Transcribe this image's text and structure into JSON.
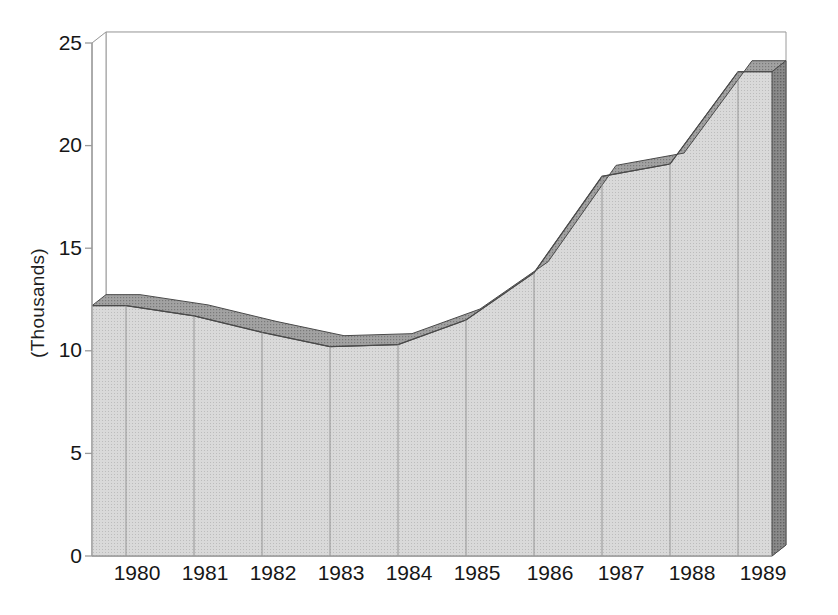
{
  "chart_data": {
    "type": "area",
    "title": "",
    "subtitle": "",
    "xlabel": "",
    "ylabel": "(Thousands)",
    "categories": [
      "1980",
      "1981",
      "1982",
      "1983",
      "1984",
      "1985",
      "1986",
      "1987",
      "1988",
      "1989"
    ],
    "values": [
      12.2,
      11.7,
      10.9,
      10.2,
      10.3,
      11.5,
      13.8,
      18.5,
      19.1,
      23.6
    ],
    "series": [
      {
        "name": "",
        "values": [
          12.2,
          11.7,
          10.9,
          10.2,
          10.3,
          11.5,
          13.8,
          18.5,
          19.1,
          23.6
        ]
      }
    ],
    "ylim": [
      0,
      25
    ],
    "yticks": [
      0,
      5,
      10,
      15,
      20,
      25
    ],
    "ytick_labels": [
      "0",
      "5",
      "10",
      "15",
      "20",
      "25"
    ],
    "xtick_labels": [
      "1980",
      "1981",
      "1982",
      "1983",
      "1984",
      "1985",
      "1986",
      "1987",
      "1988",
      "1989"
    ],
    "grid": true,
    "grid_axis": "y",
    "legend": false,
    "legend_position": "none",
    "three_d": true,
    "annotations": []
  },
  "style": {
    "background": "#ffffff",
    "area_face": "#cfcfcf",
    "area_top_ribbon": "#8f8f8f",
    "area_end_cap": "#6e6e6e",
    "outline": "#4a4a4a",
    "grid_color": "#e2e2e2",
    "axis_color": "#9a9a9a",
    "text_color": "#161616"
  },
  "axis": {
    "y_title": "(Thousands)",
    "tick_font_size": "21px"
  }
}
